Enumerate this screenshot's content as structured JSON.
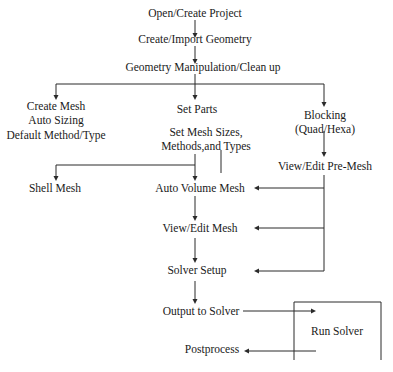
{
  "diagram": {
    "nodes": {
      "open_create_project": "Open/Create Project",
      "create_import_geometry": "Create/Import Geometry",
      "geometry_manipulation": "Geometry Manipulation/Clean up",
      "create_mesh": "Create Mesh",
      "auto_sizing": "Auto Sizing",
      "default_method": "Default Method/Type",
      "set_parts": "Set Parts",
      "set_mesh_sizes_1": "Set Mesh Sizes,",
      "set_mesh_sizes_2": "Methods,and Types",
      "blocking_1": "Blocking",
      "blocking_2": "(Quad/Hexa)",
      "view_edit_premesh": "View/Edit Pre-Mesh",
      "shell_mesh": "Shell Mesh",
      "auto_volume_mesh": "Auto Volume Mesh",
      "view_edit_mesh": "View/Edit Mesh",
      "solver_setup": "Solver Setup",
      "output_to_solver": "Output to Solver",
      "run_solver": "Run Solver",
      "postprocess": "Postprocess"
    },
    "edges": [
      [
        "Open/Create Project",
        "Create/Import Geometry"
      ],
      [
        "Create/Import Geometry",
        "Geometry Manipulation/Clean up"
      ],
      [
        "Geometry Manipulation/Clean up",
        "Create Mesh"
      ],
      [
        "Geometry Manipulation/Clean up",
        "Set Parts"
      ],
      [
        "Geometry Manipulation/Clean up",
        "Blocking"
      ],
      [
        "Blocking",
        "View/Edit Pre-Mesh"
      ],
      [
        "Set Mesh Sizes",
        "Shell Mesh"
      ],
      [
        "Set Mesh Sizes",
        "Auto Volume Mesh"
      ],
      [
        "View/Edit Pre-Mesh",
        "Auto Volume Mesh"
      ],
      [
        "View/Edit Pre-Mesh",
        "View/Edit Mesh"
      ],
      [
        "View/Edit Pre-Mesh",
        "Solver Setup"
      ],
      [
        "Auto Volume Mesh",
        "View/Edit Mesh"
      ],
      [
        "View/Edit Mesh",
        "Solver Setup"
      ],
      [
        "Solver Setup",
        "Output to Solver"
      ],
      [
        "Output to Solver",
        "Run Solver"
      ],
      [
        "Run Solver",
        "Postprocess"
      ]
    ],
    "line_color": "#2a2a2a"
  }
}
